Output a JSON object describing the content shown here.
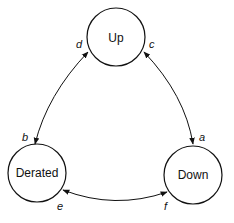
{
  "diagram": {
    "type": "state-transition",
    "nodes": [
      {
        "id": "up",
        "label": "Up"
      },
      {
        "id": "derated",
        "label": "Derated"
      },
      {
        "id": "down",
        "label": "Down"
      }
    ],
    "edges": [
      {
        "from": "up",
        "to": "down",
        "bidirectional": true,
        "labels": [
          "c",
          "a"
        ]
      },
      {
        "from": "up",
        "to": "derated",
        "bidirectional": true,
        "labels": [
          "d",
          "b"
        ]
      },
      {
        "from": "derated",
        "to": "down",
        "bidirectional": true,
        "labels": [
          "e",
          "f"
        ]
      }
    ],
    "edge_labels": {
      "a": "a",
      "b": "b",
      "c": "c",
      "d": "d",
      "e": "e",
      "f": "f"
    },
    "colors": {
      "stroke": "#111111",
      "background": "#ffffff"
    }
  }
}
